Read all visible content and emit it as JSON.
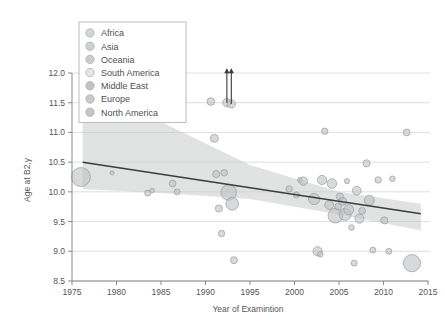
{
  "chart_data": {
    "type": "scatter",
    "title": "",
    "xlabel": "Year of Examintion",
    "ylabel": "Age at B2,y",
    "xlim": [
      1975,
      2015
    ],
    "ylim": [
      8.5,
      12.0
    ],
    "xticks": [
      1975,
      1980,
      1985,
      1990,
      1995,
      2000,
      2005,
      2010,
      2015
    ],
    "yticks": [
      8.5,
      9.0,
      9.5,
      10.0,
      10.5,
      11.0,
      11.5,
      12.0
    ],
    "xtick_labels": [
      "1975",
      "1980",
      "1985",
      "1990",
      "1995",
      "2000",
      "2005",
      "2010",
      "2015"
    ],
    "ytick_labels": [
      "8.5",
      "9.0",
      "9.5",
      "10.0",
      "10.5",
      "11.0",
      "11.5",
      "12.0"
    ],
    "grid": "horizontal",
    "legend_position": "top-left",
    "marker_encoding": "bubble size proportional to study sample size",
    "legend": [
      {
        "label": "Africa",
        "color": "#cfd1d3"
      },
      {
        "label": "Asia",
        "color": "#c9cbcd"
      },
      {
        "label": "Oceania",
        "color": "#c4c6c8"
      },
      {
        "label": "South America",
        "color": "#e0e2e4"
      },
      {
        "label": "Middle East",
        "color": "#b9bbbd"
      },
      {
        "label": "Europe",
        "color": "#c2c4c6"
      },
      {
        "label": "North America",
        "color": "#bdbfc1"
      }
    ],
    "series": [
      {
        "name": "Studies",
        "points": [
          {
            "x": 1976.0,
            "y": 10.25,
            "size": 9.5
          },
          {
            "x": 1979.5,
            "y": 10.32,
            "size": 2.0
          },
          {
            "x": 1983.5,
            "y": 9.98,
            "size": 3.0
          },
          {
            "x": 1984.0,
            "y": 10.02,
            "size": 2.2
          },
          {
            "x": 1986.3,
            "y": 10.14,
            "size": 3.4
          },
          {
            "x": 1986.8,
            "y": 10.0,
            "size": 3.0
          },
          {
            "x": 1990.6,
            "y": 11.52,
            "size": 3.8
          },
          {
            "x": 1991.0,
            "y": 10.9,
            "size": 4.0
          },
          {
            "x": 1991.2,
            "y": 10.3,
            "size": 3.6
          },
          {
            "x": 1991.5,
            "y": 9.72,
            "size": 3.6
          },
          {
            "x": 1991.8,
            "y": 9.3,
            "size": 3.2
          },
          {
            "x": 1992.1,
            "y": 10.32,
            "size": 3.3
          },
          {
            "x": 1992.4,
            "y": 11.5,
            "size": 4.2
          },
          {
            "x": 1992.6,
            "y": 9.99,
            "size": 7.8
          },
          {
            "x": 1992.9,
            "y": 11.48,
            "size": 4.2
          },
          {
            "x": 1993.0,
            "y": 9.8,
            "size": 6.4
          },
          {
            "x": 1993.2,
            "y": 8.85,
            "size": 3.5
          },
          {
            "x": 1999.4,
            "y": 10.05,
            "size": 3.2
          },
          {
            "x": 2000.2,
            "y": 9.95,
            "size": 3.0
          },
          {
            "x": 2000.6,
            "y": 10.2,
            "size": 2.4
          },
          {
            "x": 2001.0,
            "y": 10.18,
            "size": 4.2
          },
          {
            "x": 2002.2,
            "y": 9.88,
            "size": 5.6
          },
          {
            "x": 2002.6,
            "y": 9.0,
            "size": 4.6
          },
          {
            "x": 2002.9,
            "y": 8.95,
            "size": 2.8
          },
          {
            "x": 2003.1,
            "y": 10.2,
            "size": 4.6
          },
          {
            "x": 2003.4,
            "y": 11.02,
            "size": 3.2
          },
          {
            "x": 2003.9,
            "y": 9.78,
            "size": 4.4
          },
          {
            "x": 2004.2,
            "y": 10.14,
            "size": 4.8
          },
          {
            "x": 2004.6,
            "y": 9.6,
            "size": 7.4
          },
          {
            "x": 2004.9,
            "y": 9.75,
            "size": 3.4
          },
          {
            "x": 2005.1,
            "y": 9.92,
            "size": 3.6
          },
          {
            "x": 2005.4,
            "y": 9.84,
            "size": 4.0
          },
          {
            "x": 2005.7,
            "y": 9.62,
            "size": 6.0
          },
          {
            "x": 2005.9,
            "y": 10.18,
            "size": 2.6
          },
          {
            "x": 2006.1,
            "y": 9.7,
            "size": 5.0
          },
          {
            "x": 2006.4,
            "y": 9.4,
            "size": 2.8
          },
          {
            "x": 2006.7,
            "y": 8.8,
            "size": 3.0
          },
          {
            "x": 2007.0,
            "y": 10.02,
            "size": 4.4
          },
          {
            "x": 2007.3,
            "y": 9.55,
            "size": 4.6
          },
          {
            "x": 2007.6,
            "y": 9.68,
            "size": 3.4
          },
          {
            "x": 2008.1,
            "y": 10.48,
            "size": 3.6
          },
          {
            "x": 2008.4,
            "y": 9.86,
            "size": 5.0
          },
          {
            "x": 2008.8,
            "y": 9.02,
            "size": 3.0
          },
          {
            "x": 2009.4,
            "y": 10.2,
            "size": 3.2
          },
          {
            "x": 2010.1,
            "y": 9.52,
            "size": 3.6
          },
          {
            "x": 2010.6,
            "y": 9.0,
            "size": 3.0
          },
          {
            "x": 2011.0,
            "y": 10.22,
            "size": 2.8
          },
          {
            "x": 2012.6,
            "y": 11.0,
            "size": 3.4
          },
          {
            "x": 2013.2,
            "y": 8.8,
            "size": 8.6
          }
        ]
      }
    ],
    "fit_line": {
      "label": "linear trend",
      "x_start": 1976.2,
      "y_start": 10.5,
      "x_end": 2014.2,
      "y_end": 9.63
    },
    "confidence_band": {
      "label": "95% CI",
      "upper": [
        {
          "x": 1976.2,
          "y": 11.98
        },
        {
          "x": 1985.0,
          "y": 11.18
        },
        {
          "x": 1995.0,
          "y": 10.45
        },
        {
          "x": 2005.0,
          "y": 10.0
        },
        {
          "x": 2014.2,
          "y": 9.8
        }
      ],
      "lower": [
        {
          "x": 1976.2,
          "y": 10.05
        },
        {
          "x": 1985.0,
          "y": 9.98
        },
        {
          "x": 1995.0,
          "y": 9.88
        },
        {
          "x": 2005.0,
          "y": 9.62
        },
        {
          "x": 2014.2,
          "y": 9.35
        }
      ]
    },
    "annotations": [
      {
        "type": "up-arrow",
        "x": 1992.4,
        "y_from": 11.5,
        "y_to": 12.08,
        "note": "value above axis range"
      },
      {
        "type": "up-arrow",
        "x": 1992.9,
        "y_from": 11.48,
        "y_to": 12.08,
        "note": "value above axis range"
      }
    ]
  }
}
